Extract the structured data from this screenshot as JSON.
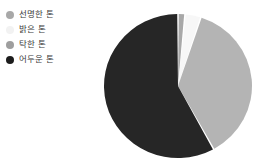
{
  "legend": {
    "items": [
      {
        "label": "선명한 톤",
        "color": "#a8a8a8",
        "marker": "circle-marker"
      },
      {
        "label": "밝은 톤",
        "color": "#f2f2f2",
        "marker": "circle-marker"
      },
      {
        "label": "탁한 톤",
        "color": "#9e9e9e",
        "marker": "circle-marker"
      },
      {
        "label": "어두운 톤",
        "color": "#1c1c1c",
        "marker": "circle-marker"
      }
    ]
  },
  "chart_data": {
    "type": "pie",
    "title": "",
    "categories": [
      "선명한 톤",
      "밝은 톤",
      "탁한 톤",
      "어두운 톤"
    ],
    "values": [
      1.5,
      3.5,
      37,
      58
    ],
    "unit": "%",
    "colors": [
      "#a8a8a8",
      "#f7f7f7",
      "#b4b4b4",
      "#262626"
    ],
    "start_angle_deg": 0,
    "direction": "clockwise",
    "legend_position": "left",
    "grid": false,
    "labels_shown": false,
    "slice_gap_deg": 1.2
  }
}
